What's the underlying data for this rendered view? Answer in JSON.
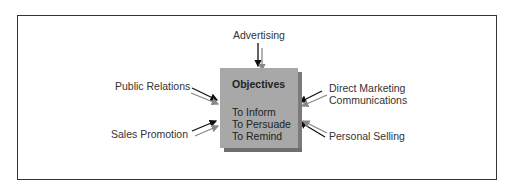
{
  "diagram": {
    "center": {
      "title": "Objectives",
      "items": [
        "To Inform",
        "To Persuade",
        "To Remind"
      ],
      "fill": "#a8a8a8"
    },
    "inputs": [
      {
        "label": "Advertising",
        "position": "top"
      },
      {
        "label": "Public Relations",
        "position": "upper-left"
      },
      {
        "label": "Sales Promotion",
        "position": "lower-left"
      },
      {
        "label": "Direct Marketing",
        "label2": "Communications",
        "position": "upper-right"
      },
      {
        "label": "Personal Selling",
        "position": "lower-right"
      }
    ]
  }
}
